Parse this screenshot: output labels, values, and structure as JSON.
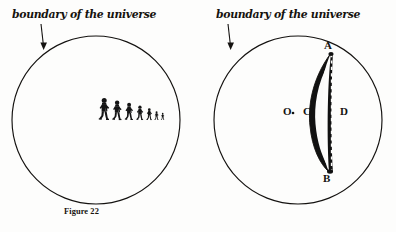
{
  "page": {
    "background_color": "#fdfdfc",
    "ink_color": "#141210",
    "width": 396,
    "height": 232
  },
  "figures": [
    {
      "id": "figure-22",
      "caption": "Figure 22",
      "boundary_label": "boundary of the universe",
      "arrow": {
        "name": "boundary-arrow",
        "direction": "down",
        "from": [
          41,
          24
        ],
        "to": [
          44,
          50
        ]
      },
      "circle": {
        "name": "universe-circle",
        "cx": 96,
        "cy": 120,
        "r": 84,
        "stroke": "#141210",
        "stroke_width": 1.1,
        "fill": "none"
      },
      "content": {
        "type": "shrinking-walkers",
        "description": "A row of walking human figures decreasing in size toward the right",
        "count": 7,
        "baseline_y": 120,
        "walkers": [
          {
            "index": 1,
            "x": 99,
            "height": 22.0,
            "label": "walker-1"
          },
          {
            "index": 2,
            "x": 113,
            "height": 19.5,
            "label": "walker-2"
          },
          {
            "index": 3,
            "x": 126,
            "height": 17.0,
            "label": "walker-3"
          },
          {
            "index": 4,
            "x": 138,
            "height": 14.0,
            "label": "walker-4"
          },
          {
            "index": 5,
            "x": 149,
            "height": 11.0,
            "label": "walker-5"
          },
          {
            "index": 6,
            "x": 157,
            "height": 8.0,
            "label": "walker-6"
          },
          {
            "index": 7,
            "x": 164,
            "height": 6.0,
            "label": "walker-7"
          }
        ]
      }
    },
    {
      "id": "figure-23",
      "caption": "Figure 23",
      "boundary_label": "boundary of the universe",
      "arrow": {
        "name": "boundary-arrow",
        "direction": "down",
        "from": [
          40,
          24
        ],
        "to": [
          43,
          50
        ]
      },
      "circle": {
        "name": "universe-circle",
        "cx": 100,
        "cy": 120,
        "r": 84,
        "stroke": "#141210",
        "stroke_width": 1.1,
        "fill": "none"
      },
      "content": {
        "type": "lens-crescent",
        "description": "A narrow vertical lens (crescent) spanning from point A at top to point B at bottom, with a dashed chord line on its right edge",
        "point_labels": [
          "A",
          "B",
          "C",
          "D",
          "O"
        ],
        "points": {
          "A": {
            "x": 131,
            "y": 51,
            "label": "A"
          },
          "B": {
            "x": 130,
            "y": 173,
            "label": "B"
          },
          "C": {
            "x": 109,
            "y": 112,
            "label": "C"
          },
          "D": {
            "x": 142,
            "y": 112,
            "label": "D"
          },
          "O": {
            "x": 87,
            "y": 112,
            "label": "O"
          }
        },
        "center_dot": {
          "x": 95,
          "y": 113,
          "r": 1.3,
          "name": "center-dot"
        },
        "lens_fill": "#111111",
        "dashed_line_from": [
          133,
          53
        ],
        "dashed_line_to": [
          133,
          172
        ]
      }
    }
  ]
}
